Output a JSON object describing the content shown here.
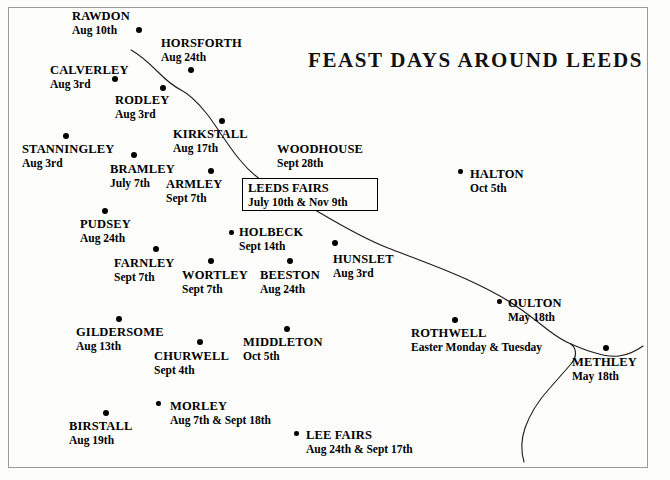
{
  "map": {
    "title": "FEAST DAYS AROUND LEEDS",
    "frame_color": "#9a9a9a",
    "background_color": "#fdfdfc",
    "ink_color": "#000000",
    "width": 670,
    "height": 480
  },
  "leeds_fairs": {
    "name": "LEEDS FAIRS",
    "date": "July 10th & Nov 9th"
  },
  "places": [
    {
      "name": "RAWDON",
      "date": "Aug 10th",
      "label_x": 72,
      "label_y": 10,
      "dot_x": 139,
      "dot_y": 30,
      "align": "left"
    },
    {
      "name": "HORSFORTH",
      "date": "Aug 24th",
      "label_x": 161,
      "label_y": 37,
      "dot_x": 191,
      "dot_y": 70,
      "align": "left"
    },
    {
      "name": "CALVERLEY",
      "date": "Aug 3rd",
      "label_x": 50,
      "label_y": 64,
      "dot_x": 115,
      "dot_y": 79,
      "align": "left"
    },
    {
      "name": "RODLEY",
      "date": "Aug 3rd",
      "label_x": 115,
      "label_y": 94,
      "dot_x": 163,
      "dot_y": 88,
      "align": "left"
    },
    {
      "name": "KIRKSTALL",
      "date": "Aug 17th",
      "label_x": 173,
      "label_y": 128,
      "dot_x": 222,
      "dot_y": 121,
      "align": "left"
    },
    {
      "name": "WOODHOUSE",
      "date": "Sept 28th",
      "label_x": 277,
      "label_y": 143,
      "dot_x": null,
      "dot_y": null,
      "align": "left"
    },
    {
      "name": "STANNINGLEY",
      "date": "Aug 3rd",
      "label_x": 22,
      "label_y": 143,
      "dot_x": 66,
      "dot_y": 136,
      "align": "left"
    },
    {
      "name": "HALTON",
      "date": "Oct 5th",
      "label_x": 470,
      "label_y": 168,
      "dot_x": 461,
      "dot_y": 172,
      "align": "left"
    },
    {
      "name": "BRAMLEY",
      "date": "July 7th",
      "label_x": 110,
      "label_y": 163,
      "dot_x": 134,
      "dot_y": 155,
      "align": "left"
    },
    {
      "name": "ARMLEY",
      "date": "Sept 7th",
      "label_x": 166,
      "label_y": 178,
      "dot_x": 211,
      "dot_y": 171,
      "align": "left"
    },
    {
      "name": "PUDSEY",
      "date": "Aug 24th",
      "label_x": 80,
      "label_y": 218,
      "dot_x": 105,
      "dot_y": 211,
      "align": "left"
    },
    {
      "name": "HOLBECK",
      "date": "Sept 14th",
      "label_x": 239,
      "label_y": 226,
      "dot_x": 232,
      "dot_y": 233,
      "align": "left"
    },
    {
      "name": "FARNLEY",
      "date": "Sept 7th",
      "label_x": 114,
      "label_y": 257,
      "dot_x": 156,
      "dot_y": 249,
      "align": "left"
    },
    {
      "name": "WORTLEY",
      "date": "Sept 7th",
      "label_x": 182,
      "label_y": 269,
      "dot_x": 211,
      "dot_y": 261,
      "align": "left"
    },
    {
      "name": "BEESTON",
      "date": "Aug 24th",
      "label_x": 260,
      "label_y": 269,
      "dot_x": 290,
      "dot_y": 261,
      "align": "left"
    },
    {
      "name": "HUNSLET",
      "date": "Aug 3rd",
      "label_x": 333,
      "label_y": 253,
      "dot_x": 335,
      "dot_y": 243,
      "align": "left"
    },
    {
      "name": "OULTON",
      "date": "May 18th",
      "label_x": 508,
      "label_y": 297,
      "dot_x": 500,
      "dot_y": 302,
      "align": "left"
    },
    {
      "name": "ROTHWELL",
      "date": "Easter Monday & Tuesday",
      "label_x": 411,
      "label_y": 327,
      "dot_x": 455,
      "dot_y": 320,
      "align": "left"
    },
    {
      "name": "METHLEY",
      "date": "May 18th",
      "label_x": 572,
      "label_y": 356,
      "dot_x": 606,
      "dot_y": 348,
      "align": "left"
    },
    {
      "name": "GILDERSOME",
      "date": "Aug 13th",
      "label_x": 76,
      "label_y": 326,
      "dot_x": 119,
      "dot_y": 319,
      "align": "left"
    },
    {
      "name": "MIDDLETON",
      "date": "Oct 5th",
      "label_x": 243,
      "label_y": 336,
      "dot_x": 287,
      "dot_y": 329,
      "align": "left"
    },
    {
      "name": "CHURWELL",
      "date": "Sept 4th",
      "label_x": 154,
      "label_y": 350,
      "dot_x": 200,
      "dot_y": 342,
      "align": "left"
    },
    {
      "name": "MORLEY",
      "date": "Aug 7th & Sept 18th",
      "label_x": 170,
      "label_y": 400,
      "dot_x": 159,
      "dot_y": 404,
      "align": "left"
    },
    {
      "name": "BIRSTALL",
      "date": "Aug 19th",
      "label_x": 69,
      "label_y": 420,
      "dot_x": 106,
      "dot_y": 413,
      "align": "left"
    },
    {
      "name": "LEE FAIRS",
      "date": "Aug 24th & Sept 17th",
      "label_x": 306,
      "label_y": 429,
      "dot_x": 297,
      "dot_y": 434,
      "align": "left"
    }
  ],
  "rivers": [
    {
      "name": "river-aire",
      "path": "M 131,50 C 142,56 150,64 158,72 C 166,80 173,86 181,90 C 191,95 199,104 207,114 C 214,123 218,130 223,137 C 228,144 233,152 240,160 C 248,170 258,179 270,186 C 286,195 305,204 322,214 C 344,227 365,239 388,248 C 414,258 442,268 466,279 C 486,288 503,297 516,306 C 528,314 538,322 548,330 C 556,336 563,341 571,344"
    },
    {
      "name": "river-aire-lower",
      "path": "M 571,344 C 578,347 585,350 592,352 C 601,355 610,357 619,356 C 628,355 636,351 643,346"
    },
    {
      "name": "river-calder",
      "path": "M 524,462 C 521,452 521,440 525,428 C 530,414 539,400 549,389 C 557,380 564,372 571,364 C 576,358 578,350 571,344"
    }
  ]
}
